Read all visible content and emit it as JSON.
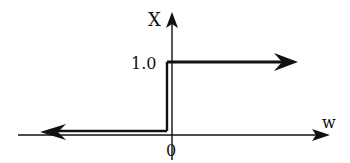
{
  "diagram": {
    "type": "step-function-plot",
    "axes": {
      "x_label": "w",
      "y_label": "X",
      "origin_label": "0",
      "y_tick_label": "1.0"
    },
    "curve": {
      "segments": [
        {
          "name": "lower",
          "value": 0,
          "range": "w < 0",
          "direction": "left"
        },
        {
          "name": "jump",
          "at": 0,
          "from": 0,
          "to": 1.0
        },
        {
          "name": "upper",
          "value": 1.0,
          "range": "w > 0",
          "direction": "right"
        }
      ]
    },
    "colors": {
      "line": "#111111",
      "background": "#ffffff"
    }
  }
}
